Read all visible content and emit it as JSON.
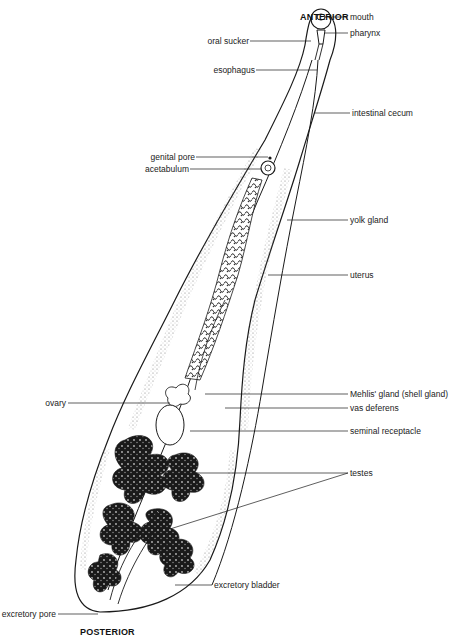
{
  "diagram": {
    "orientation": {
      "top": "ANTERIOR",
      "bottom": "POSTERIOR"
    },
    "labels": {
      "oral_sucker": "oral sucker",
      "mouth": "mouth",
      "pharynx": "pharynx",
      "esophagus": "esophagus",
      "intestinal_cecum": "intestinal cecum",
      "genital_pore": "genital pore",
      "acetabulum": "acetabulum",
      "yolk_gland": "yolk gland",
      "uterus": "uterus",
      "mehlis_gland": "Mehlis' gland (shell gland)",
      "vas_deferens": "vas deferens",
      "ovary": "ovary",
      "seminal_receptacle": "seminal receptacle",
      "testes": "testes",
      "excretory_bladder": "excretory bladder",
      "excretory_pore": "excretory pore"
    },
    "colors": {
      "line": "#1a1a1a",
      "background": "#ffffff",
      "stipple": "#777777"
    }
  }
}
